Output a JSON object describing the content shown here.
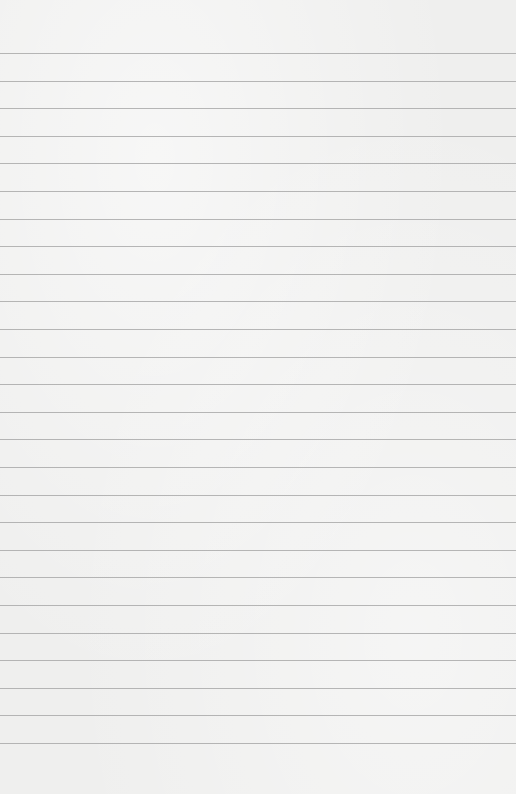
{
  "paper": {
    "type": "lined-paper",
    "background_color": "#efefee",
    "line_color": "#a9a9a9",
    "first_line_y": 53,
    "line_spacing": 27.6,
    "line_count": 26
  }
}
